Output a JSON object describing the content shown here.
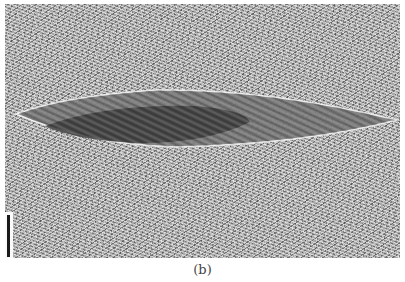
{
  "figure": {
    "panel_label": "(b)",
    "scale_bar": {
      "present": true,
      "orientation": "vertical",
      "color": "#1a1a1a"
    },
    "colors": {
      "background": "#a9a9a9",
      "particle_outer": "#6e6e6e",
      "particle_inner": "#3f3f3f",
      "rim": "#f0f0f0"
    }
  }
}
